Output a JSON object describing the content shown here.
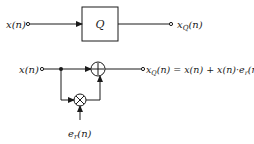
{
  "diagram": {
    "top": {
      "input_label": "x(n)",
      "block_label": "Q",
      "output_label_main": "x",
      "output_label_sub": "Q",
      "output_label_tail": "(n)"
    },
    "bottom": {
      "input_label": "x(n)",
      "adder_symbol": "+",
      "multiplier_symbol": "×",
      "output_main": "x",
      "output_sub": "Q",
      "output_tail": "(n) = x(n) + x(n)·e",
      "output_sub2": "r",
      "output_tail2": "(n)",
      "noise_main": "e",
      "noise_sub": "r",
      "noise_tail": "(n)"
    },
    "colors": {
      "ink": "#1a1a1a",
      "background": "#ffffff"
    }
  }
}
